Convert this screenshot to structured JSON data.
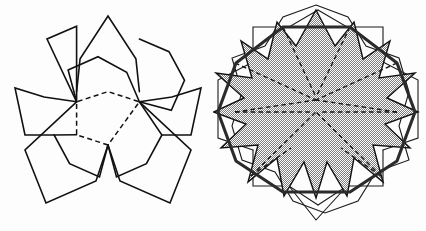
{
  "image": {
    "title": "Pentagon net and folded dodecahedron-cap overlay",
    "width": 426,
    "height": 231,
    "background_color": "#fdfdfd",
    "line_color": "#111111",
    "hull_color": "#2b2b2b",
    "shaded_fill_color": "#b0b0b0",
    "shaded_fill_style": "50% dithered checkerboard halftone"
  },
  "panels": [
    {
      "id": "left",
      "name": "pentagon-net",
      "description": "Central regular pentagon with dashed fold edges, five solid-outlined pentagons attached to each edge forming a five-petal flower net",
      "center": {
        "x": 108,
        "y": 112
      },
      "central_pentagon": {
        "circumradius": 33,
        "rotation_deg": 180,
        "edge_style": "dashed",
        "vertices": [
          {
            "x": 108.0,
            "y": 145.0
          },
          {
            "x": 76.6,
            "y": 134.8
          },
          {
            "x": 76.6,
            "y": 101.8
          },
          {
            "x": 108.0,
            "y": 91.6
          },
          {
            "x": 139.4,
            "y": 101.8
          }
        ]
      },
      "flap_count": 5,
      "flap_edge_style": "solid",
      "extents": {
        "left": 14,
        "right": 201,
        "top": 16,
        "bottom": 203
      }
    },
    {
      "id": "right",
      "name": "overlaid-pentagon-nets",
      "description": "Two pentagon nets superimposed and rotated relative to one another; the shaded union forms a ten-pointed star; a heavy decagon hull joins the outer vertices; interior fold edges shown dashed",
      "center": {
        "x": 316,
        "y": 112
      },
      "layers": [
        {
          "name": "net-a",
          "rotation_deg": 0,
          "stroke": "thin solid",
          "description": "first pentagon net, upright"
        },
        {
          "name": "net-b",
          "rotation_deg": 36,
          "stroke": "thin solid",
          "description": "second pentagon net rotated 36 degrees"
        },
        {
          "name": "star-region",
          "fill": "#b0b0b0",
          "points": 10,
          "description": "shaded ten-pointed star formed by the overlap of the two nets"
        },
        {
          "name": "hull-decagon",
          "stroke": "thick solid",
          "sides": 10,
          "description": "heavy decagon outline through the shared outer vertices"
        }
      ],
      "extents": {
        "left": 218,
        "right": 412,
        "top": 10,
        "bottom": 220
      }
    }
  ],
  "geometry_notes": {
    "pentagon_interior_angle_deg": 108,
    "decagon_interior_angle_deg": 144,
    "net_petals": 5,
    "star_points": 10
  }
}
